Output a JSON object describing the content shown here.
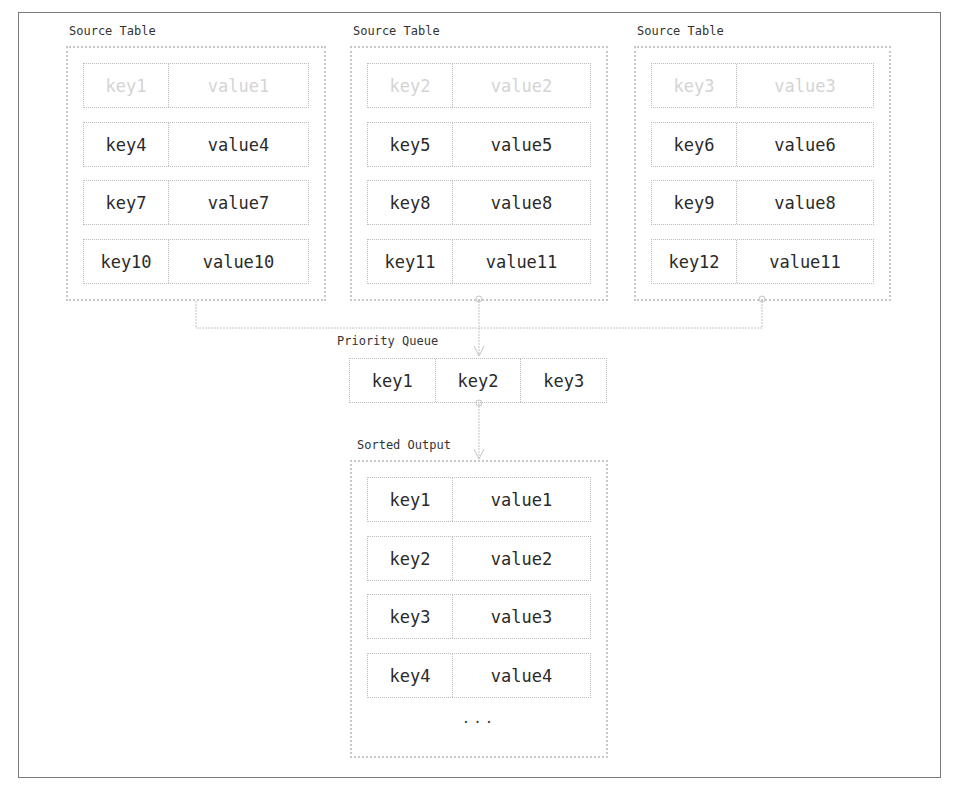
{
  "source_tables": [
    {
      "caption": "Source Table",
      "rows": [
        {
          "key": "key1",
          "value": "value1",
          "faded": true
        },
        {
          "key": "key4",
          "value": "value4",
          "faded": false
        },
        {
          "key": "key7",
          "value": "value7",
          "faded": false
        },
        {
          "key": "key10",
          "value": "value10",
          "faded": false
        }
      ]
    },
    {
      "caption": "Source Table",
      "rows": [
        {
          "key": "key2",
          "value": "value2",
          "faded": true
        },
        {
          "key": "key5",
          "value": "value5",
          "faded": false
        },
        {
          "key": "key8",
          "value": "value8",
          "faded": false
        },
        {
          "key": "key11",
          "value": "value11",
          "faded": false
        }
      ]
    },
    {
      "caption": "Source Table",
      "rows": [
        {
          "key": "key3",
          "value": "value3",
          "faded": true
        },
        {
          "key": "key6",
          "value": "value6",
          "faded": false
        },
        {
          "key": "key9",
          "value": "value8",
          "faded": false
        },
        {
          "key": "key12",
          "value": "value11",
          "faded": false
        }
      ]
    }
  ],
  "priority_queue": {
    "caption": "Priority Queue",
    "keys": [
      "key1",
      "key2",
      "key3"
    ]
  },
  "sorted_output": {
    "caption": "Sorted Output",
    "rows": [
      {
        "key": "key1",
        "value": "value1"
      },
      {
        "key": "key2",
        "value": "value2"
      },
      {
        "key": "key3",
        "value": "value3"
      },
      {
        "key": "key4",
        "value": "value4"
      }
    ],
    "ellipsis": "..."
  },
  "colors": {
    "connector": "#c4c4c4",
    "border": "#c8c8c8",
    "faded_text": "#d4d4d4",
    "text": "#2a2a2a"
  }
}
